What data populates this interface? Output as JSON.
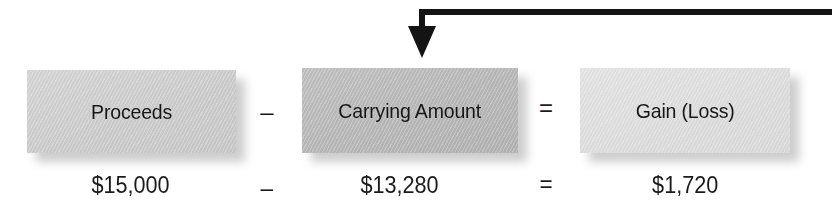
{
  "figure": {
    "name": "gain-loss-formula-diagram",
    "arrow": {
      "icon": "down-arrow-icon",
      "description": "elbow arrow entering from the right edge and pointing down into the Carrying Amount box",
      "color": "#141414"
    },
    "terms": [
      {
        "id": "proceeds",
        "label": "Proceeds",
        "value": "$15,000",
        "box_color": "#d0d0d0"
      },
      {
        "id": "carrying-amount",
        "label": "Carrying Amount",
        "value": "$13,280",
        "box_color": "#bababa"
      },
      {
        "id": "gain-loss",
        "label": "Gain (Loss)",
        "value": "$1,720",
        "box_color": "#dedede"
      }
    ],
    "operators": {
      "minus": "–",
      "equals": "="
    }
  }
}
